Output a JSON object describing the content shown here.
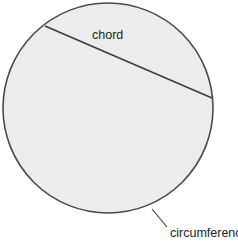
{
  "diagram": {
    "colors": {
      "background": "#ffffff",
      "circle_fill": "#ececec",
      "stroke": "#4a4a4a",
      "text": "#222222"
    },
    "circle": {
      "cx": 108,
      "cy": 108,
      "r": 105
    },
    "chord": {
      "x1": 45,
      "y1": 26,
      "x2": 212,
      "y2": 98,
      "label": "chord",
      "label_x": 92,
      "label_y": 39
    },
    "circumference": {
      "label": "circumference",
      "label_x": 170,
      "label_y": 237,
      "leader_x1": 152,
      "leader_y1": 209,
      "leader_x2": 167,
      "leader_y2": 227
    }
  }
}
